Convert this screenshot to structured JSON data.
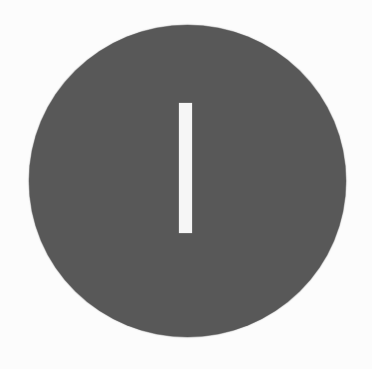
{
  "graphic": {
    "description": "Dark gray circle with a single vertical white bar (I / power-on symbol)",
    "glyph": "I",
    "icon": "circle-bar-icon",
    "colors": {
      "background": "#fcfcfc",
      "circle": "#585858",
      "bar": "#f6f6f6"
    }
  }
}
